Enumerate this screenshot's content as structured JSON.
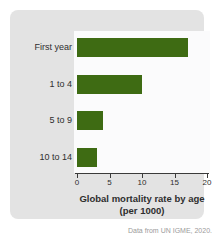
{
  "caption": "Data from UN IGME, 2020.",
  "colors": {
    "card_bg": "#e3e3e3",
    "plot_bg": "#fbfbfc",
    "bar": "#3e6b13",
    "label_text": "#2e2e2e",
    "axis": "#3a3a3a",
    "caption_text": "#9b9b9b"
  },
  "chart_data": {
    "type": "bar",
    "orientation": "horizontal",
    "title": "",
    "categories": [
      "First year",
      "1 to 4",
      "5 to 9",
      "10 to 14"
    ],
    "values": [
      17,
      10,
      4,
      3
    ],
    "xlabel": "Global mortality rate by age",
    "xlabel_sub": "(per 1000)",
    "xlim": [
      0,
      20
    ],
    "xticks": [
      0,
      5,
      10,
      15,
      20
    ],
    "grid": false,
    "legend": false
  }
}
